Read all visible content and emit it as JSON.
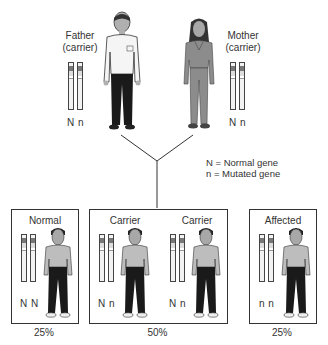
{
  "parents": {
    "father": {
      "label": "Father",
      "status": "(carrier)",
      "genes": "N n"
    },
    "mother": {
      "label": "Mother",
      "status": "(carrier)",
      "genes": "N n"
    }
  },
  "legend": {
    "normal": "N = Normal gene",
    "mutated": "n = Mutated gene"
  },
  "offspring": [
    {
      "label": "Normal",
      "genes": "N N",
      "percent": "25%"
    },
    {
      "label": "Carrier",
      "genes": "N n"
    },
    {
      "label": "Carrier",
      "genes": "N n"
    },
    {
      "label": "Affected",
      "genes": "n n",
      "percent": "25%"
    }
  ],
  "carrier_percent": "50%",
  "colors": {
    "outline": "#333333",
    "chromosome_band_dark": "#777777",
    "shirt_male_light": "#f5f5f5",
    "pants_dark": "#1a1a1a",
    "female_dress": "#8c8c8c",
    "child_shirt": "#bdbdbd"
  }
}
